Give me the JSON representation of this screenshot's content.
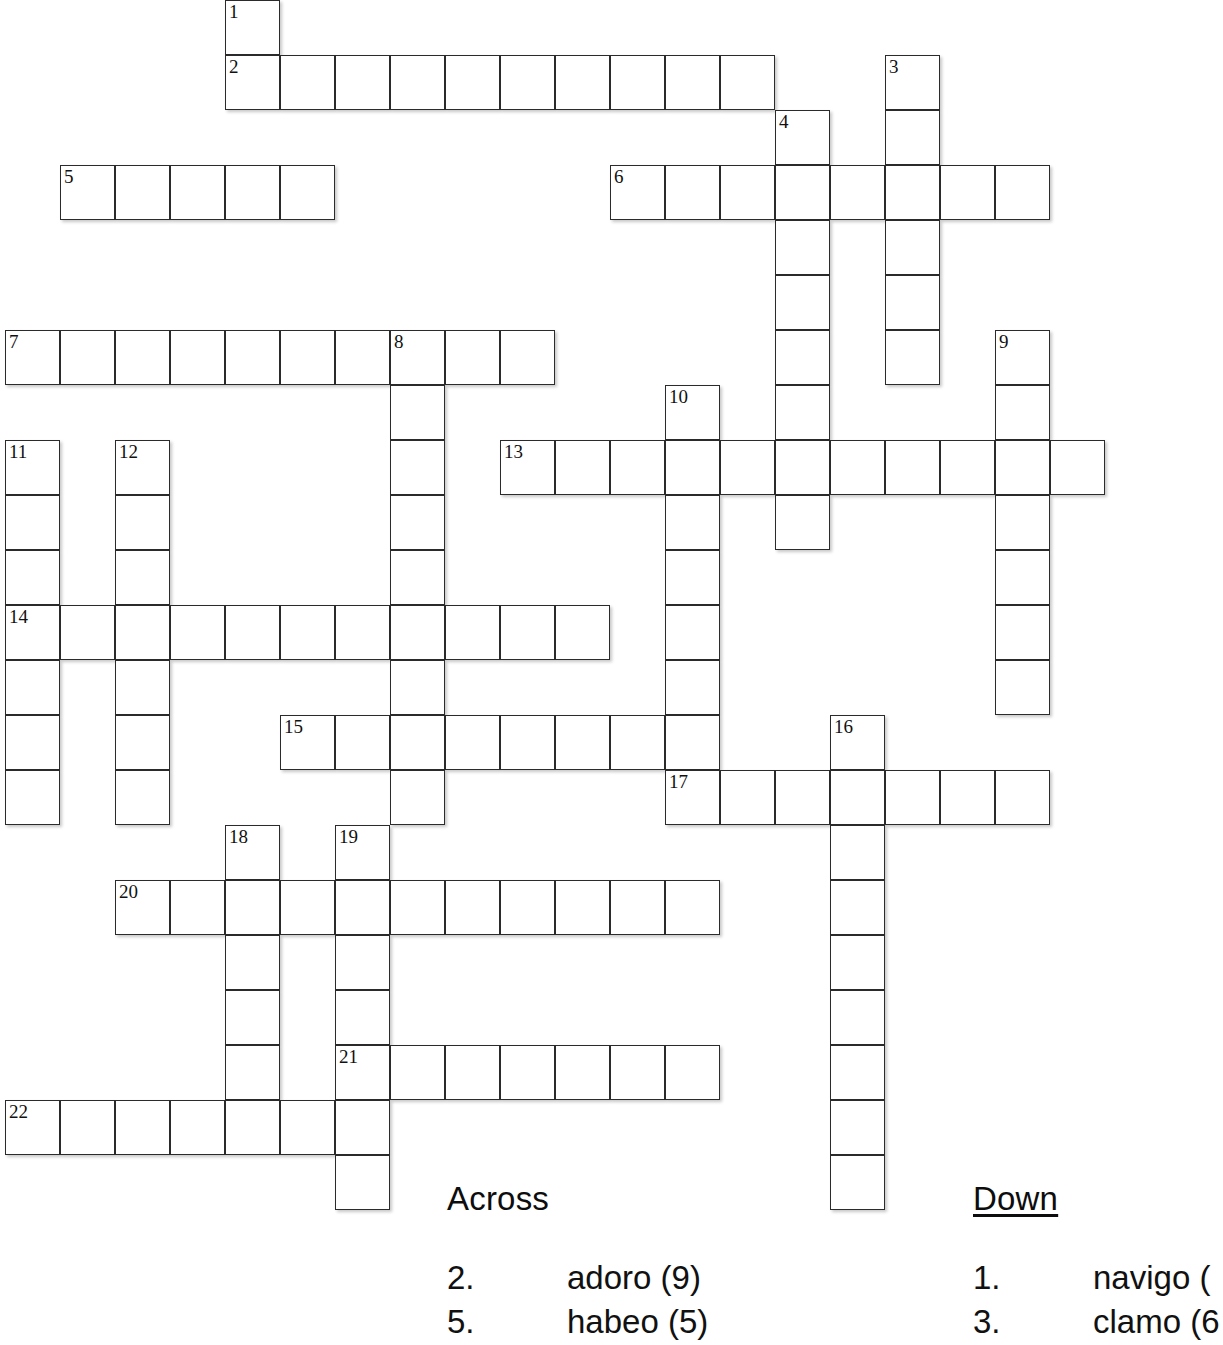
{
  "puzzle": {
    "title": "Latin Verbs Crossword",
    "cell_size": 55,
    "grid_origin": {
      "x": 5,
      "y": 0
    },
    "entries": [
      {
        "number": "1",
        "direction": "down",
        "col": 4,
        "row": 0,
        "length": 1
      },
      {
        "number": "2",
        "direction": "across",
        "col": 4,
        "row": 1,
        "length": 10
      },
      {
        "number": "3",
        "direction": "down",
        "col": 16,
        "row": 1,
        "length": 6
      },
      {
        "number": "4",
        "direction": "down",
        "col": 14,
        "row": 2,
        "length": 8
      },
      {
        "number": "5",
        "direction": "across",
        "col": 1,
        "row": 3,
        "length": 5
      },
      {
        "number": "6",
        "direction": "across",
        "col": 11,
        "row": 3,
        "length": 8
      },
      {
        "number": "7",
        "direction": "across",
        "col": 0,
        "row": 6,
        "length": 10
      },
      {
        "number": "8",
        "direction": "down",
        "col": 7,
        "row": 6,
        "length": 9
      },
      {
        "number": "9",
        "direction": "down",
        "col": 18,
        "row": 6,
        "length": 7
      },
      {
        "number": "10",
        "direction": "down",
        "col": 12,
        "row": 7,
        "length": 8
      },
      {
        "number": "11",
        "direction": "down",
        "col": 0,
        "row": 8,
        "length": 7
      },
      {
        "number": "12",
        "direction": "down",
        "col": 2,
        "row": 8,
        "length": 7
      },
      {
        "number": "13",
        "direction": "across",
        "col": 9,
        "row": 8,
        "length": 11
      },
      {
        "number": "14",
        "direction": "across",
        "col": 0,
        "row": 11,
        "length": 11
      },
      {
        "number": "15",
        "direction": "across",
        "col": 5,
        "row": 13,
        "length": 8
      },
      {
        "number": "16",
        "direction": "down",
        "col": 15,
        "row": 13,
        "length": 9
      },
      {
        "number": "17",
        "direction": "across",
        "col": 12,
        "row": 14,
        "length": 7
      },
      {
        "number": "18",
        "direction": "down",
        "col": 4,
        "row": 15,
        "length": 6
      },
      {
        "number": "19",
        "direction": "down",
        "col": 6,
        "row": 15,
        "length": 7
      },
      {
        "number": "20",
        "direction": "across",
        "col": 2,
        "row": 16,
        "length": 11
      },
      {
        "number": "21",
        "direction": "across",
        "col": 6,
        "row": 19,
        "length": 7
      },
      {
        "number": "22",
        "direction": "across",
        "col": 0,
        "row": 20,
        "length": 7
      }
    ]
  },
  "clues": {
    "across": {
      "heading": "Across",
      "items": [
        {
          "number": "2.",
          "text": "adoro (9)"
        },
        {
          "number": "5.",
          "text": "habeo (5)"
        }
      ]
    },
    "down": {
      "heading": "Down",
      "items": [
        {
          "number": "1.",
          "text": "navigo ("
        },
        {
          "number": "3.",
          "text": "clamo (6"
        }
      ]
    }
  }
}
